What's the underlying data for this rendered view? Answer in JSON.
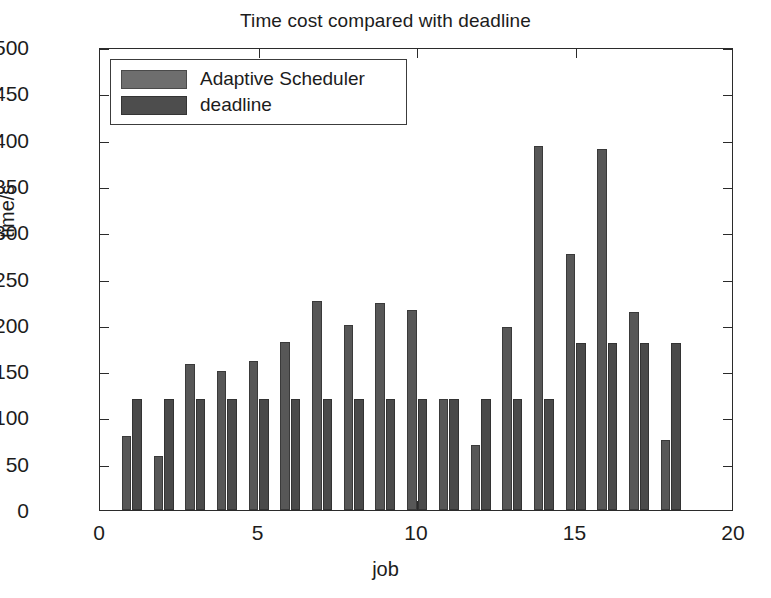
{
  "chart_data": {
    "type": "bar",
    "title": "Time cost compared with deadline",
    "xlabel": "job",
    "ylabel": "time/s",
    "categories": [
      1,
      2,
      3,
      4,
      5,
      6,
      7,
      8,
      9,
      10,
      11,
      12,
      13,
      14,
      15,
      16,
      17,
      18
    ],
    "series": [
      {
        "name": "Adaptive Scheduler",
        "color": "#6e6e6e",
        "values": [
          80,
          58,
          158,
          150,
          161,
          181,
          226,
          200,
          224,
          216,
          120,
          70,
          198,
          393,
          276,
          390,
          214,
          76
        ]
      },
      {
        "name": "deadline",
        "color": "#4d4d4d",
        "values": [
          120,
          120,
          120,
          120,
          120,
          120,
          120,
          120,
          120,
          120,
          120,
          120,
          120,
          120,
          180,
          180,
          180,
          180
        ]
      }
    ],
    "xlim": [
      0,
      20
    ],
    "ylim": [
      0,
      500
    ],
    "xticks": [
      0,
      5,
      10,
      15,
      20
    ],
    "yticks": [
      0,
      50,
      100,
      150,
      200,
      250,
      300,
      350,
      400,
      450,
      500
    ],
    "xtick_labels": [
      "0",
      "5",
      "10",
      "15",
      "20"
    ],
    "ytick_labels": [
      "0",
      "50",
      "100",
      "150",
      "200",
      "250",
      "300",
      "350",
      "400",
      "450",
      "500"
    ],
    "grid": false,
    "legend_position": "upper-left"
  },
  "legend": {
    "entries": [
      {
        "label": "Adaptive Scheduler"
      },
      {
        "label": "deadline"
      }
    ]
  }
}
